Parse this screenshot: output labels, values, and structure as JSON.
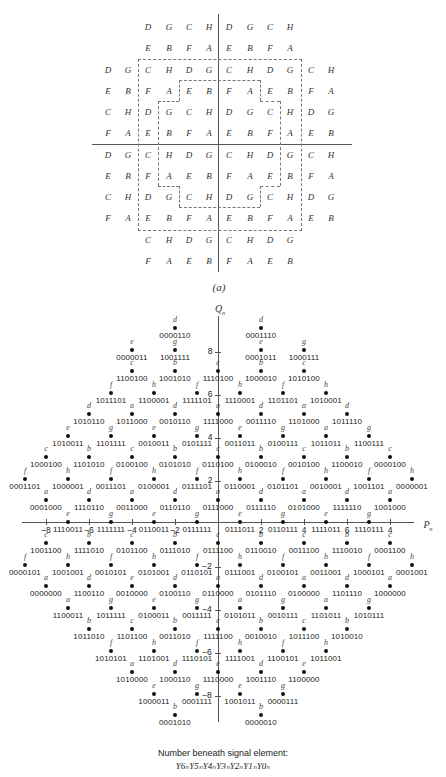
{
  "part_a": {
    "caption": "(a)",
    "rows": [
      {
        "y": 27,
        "cells": [
          "",
          "",
          "D",
          "G",
          "C",
          "H",
          "D",
          "G",
          "C",
          "H",
          "",
          ""
        ]
      },
      {
        "y": 48,
        "cells": [
          "",
          "",
          "E",
          "B",
          "F",
          "A",
          "E",
          "B",
          "F",
          "A",
          "",
          ""
        ]
      },
      {
        "y": 70,
        "cells": [
          "D",
          "G",
          "C",
          "H",
          "D",
          "G",
          "C",
          "H",
          "D",
          "G",
          "C",
          "H"
        ]
      },
      {
        "y": 91,
        "cells": [
          "E",
          "B",
          "F",
          "A",
          "E",
          "B",
          "F",
          "A",
          "E",
          "B",
          "F",
          "A"
        ]
      },
      {
        "y": 112,
        "cells": [
          "C",
          "H",
          "D",
          "G",
          "C",
          "H",
          "D",
          "G",
          "C",
          "H",
          "D",
          "G"
        ]
      },
      {
        "y": 133,
        "cells": [
          "F",
          "A",
          "E",
          "B",
          "F",
          "A",
          "E",
          "B",
          "F",
          "A",
          "E",
          "B"
        ]
      },
      {
        "y": 155,
        "cells": [
          "D",
          "G",
          "C",
          "H",
          "D",
          "G",
          "C",
          "H",
          "D",
          "G",
          "C",
          "H"
        ]
      },
      {
        "y": 176,
        "cells": [
          "E",
          "B",
          "F",
          "A",
          "E",
          "B",
          "F",
          "A",
          "E",
          "B",
          "F",
          "A"
        ]
      },
      {
        "y": 197,
        "cells": [
          "C",
          "H",
          "D",
          "G",
          "C",
          "H",
          "D",
          "G",
          "C",
          "H",
          "D",
          "G"
        ]
      },
      {
        "y": 218,
        "cells": [
          "F",
          "A",
          "E",
          "B",
          "F",
          "A",
          "E",
          "B",
          "F",
          "A",
          "E",
          "B"
        ]
      },
      {
        "y": 240,
        "cells": [
          "",
          "",
          "C",
          "H",
          "D",
          "G",
          "C",
          "H",
          "D",
          "G",
          "",
          ""
        ]
      },
      {
        "y": 261,
        "cells": [
          "",
          "",
          "F",
          "A",
          "E",
          "B",
          "F",
          "A",
          "E",
          "B",
          "",
          ""
        ]
      }
    ],
    "columns_x": [
      108,
      128,
      148,
      169,
      189,
      209,
      229,
      250,
      270,
      290,
      311,
      331
    ]
  },
  "part_b": {
    "y_axis_label": "Q",
    "y_axis_sub": "n",
    "x_axis_label": "P",
    "x_axis_sub": "n",
    "x_ticks": [
      {
        "x": 46,
        "label": "−8"
      },
      {
        "x": 89,
        "label": "−6"
      },
      {
        "x": 132,
        "label": "−4"
      },
      {
        "x": 175,
        "label": "−2"
      },
      {
        "x": 261,
        "label": "2"
      },
      {
        "x": 304,
        "label": "4"
      },
      {
        "x": 347,
        "label": "6"
      },
      {
        "x": 390,
        "label": "4"
      }
    ],
    "y_ticks": [
      {
        "y": 352,
        "label": "8"
      },
      {
        "y": 395,
        "label": "6"
      },
      {
        "y": 438,
        "label": "4"
      },
      {
        "y": 481,
        "label": "2"
      },
      {
        "y": 567,
        "label": "−2"
      },
      {
        "y": 610,
        "label": "−4"
      },
      {
        "y": 653,
        "label": "−6"
      },
      {
        "y": 696,
        "label": "−8"
      }
    ],
    "points": [
      {
        "x": 175,
        "y": 328,
        "l": "d",
        "c": "0000110"
      },
      {
        "x": 261,
        "y": 328,
        "l": "d",
        "c": "0001110"
      },
      {
        "x": 132,
        "y": 350,
        "l": "e",
        "c": "0000011"
      },
      {
        "x": 175,
        "y": 350,
        "l": "g",
        "c": "1001111"
      },
      {
        "x": 261,
        "y": 350,
        "l": "e",
        "c": "0001011"
      },
      {
        "x": 304,
        "y": 350,
        "l": "g",
        "c": "1000111"
      },
      {
        "x": 132,
        "y": 371,
        "l": "c",
        "c": "1100100"
      },
      {
        "x": 175,
        "y": 371,
        "l": "b",
        "c": "1001010"
      },
      {
        "x": 218,
        "y": 371,
        "l": "c",
        "c": "1110100"
      },
      {
        "x": 261,
        "y": 371,
        "l": "b",
        "c": "1000010"
      },
      {
        "x": 304,
        "y": 371,
        "l": "c",
        "c": "1010100"
      },
      {
        "x": 111,
        "y": 393,
        "l": "f",
        "c": "1011101"
      },
      {
        "x": 154,
        "y": 393,
        "l": "h",
        "c": "1100001"
      },
      {
        "x": 197,
        "y": 393,
        "l": "f",
        "c": "1111101"
      },
      {
        "x": 240,
        "y": 393,
        "l": "h",
        "c": "1110001"
      },
      {
        "x": 283,
        "y": 393,
        "l": "f",
        "c": "1101101"
      },
      {
        "x": 326,
        "y": 393,
        "l": "h",
        "c": "1010001"
      },
      {
        "x": 89,
        "y": 414,
        "l": "d",
        "c": "1010110"
      },
      {
        "x": 132,
        "y": 414,
        "l": "a",
        "c": "1011000"
      },
      {
        "x": 175,
        "y": 414,
        "l": "d",
        "c": "0010110"
      },
      {
        "x": 218,
        "y": 414,
        "l": "a",
        "c": "1111000"
      },
      {
        "x": 261,
        "y": 414,
        "l": "d",
        "c": "0011110"
      },
      {
        "x": 304,
        "y": 414,
        "l": "a",
        "c": "1101000"
      },
      {
        "x": 347,
        "y": 414,
        "l": "d",
        "c": "1011110"
      },
      {
        "x": 68,
        "y": 436,
        "l": "e",
        "c": "1010011"
      },
      {
        "x": 111,
        "y": 436,
        "l": "g",
        "c": "1101111"
      },
      {
        "x": 154,
        "y": 436,
        "l": "e",
        "c": "0010011"
      },
      {
        "x": 197,
        "y": 436,
        "l": "g",
        "c": "0101111"
      },
      {
        "x": 240,
        "y": 436,
        "l": "e",
        "c": "0011011"
      },
      {
        "x": 283,
        "y": 436,
        "l": "g",
        "c": "0100111"
      },
      {
        "x": 326,
        "y": 436,
        "l": "a",
        "c": "1011011"
      },
      {
        "x": 369,
        "y": 436,
        "l": "g",
        "c": "1100111"
      },
      {
        "x": 46,
        "y": 457,
        "l": "c",
        "c": "1000100"
      },
      {
        "x": 89,
        "y": 457,
        "l": "b",
        "c": "1101010"
      },
      {
        "x": 132,
        "y": 457,
        "l": "c",
        "c": "0100100"
      },
      {
        "x": 175,
        "y": 457,
        "l": "b",
        "c": "0101010"
      },
      {
        "x": 218,
        "y": 457,
        "l": "c",
        "c": "0110100"
      },
      {
        "x": 261,
        "y": 457,
        "l": "b",
        "c": "0100010"
      },
      {
        "x": 304,
        "y": 457,
        "l": "c",
        "c": "0010100"
      },
      {
        "x": 347,
        "y": 457,
        "l": "b",
        "c": "1100010"
      },
      {
        "x": 390,
        "y": 457,
        "l": "c",
        "c": "0000100"
      },
      {
        "x": 25,
        "y": 479,
        "l": "f",
        "c": "0001101"
      },
      {
        "x": 68,
        "y": 479,
        "l": "h",
        "c": "1000001"
      },
      {
        "x": 111,
        "y": 479,
        "l": "f",
        "c": "0011101"
      },
      {
        "x": 154,
        "y": 479,
        "l": "h",
        "c": "0100001"
      },
      {
        "x": 197,
        "y": 479,
        "l": "f",
        "c": "0111101"
      },
      {
        "x": 240,
        "y": 479,
        "l": "h",
        "c": "0110001"
      },
      {
        "x": 283,
        "y": 479,
        "l": "f",
        "c": "0101101"
      },
      {
        "x": 326,
        "y": 479,
        "l": "h",
        "c": "0010001"
      },
      {
        "x": 369,
        "y": 479,
        "l": "f",
        "c": "1001101"
      },
      {
        "x": 412,
        "y": 479,
        "l": "h",
        "c": "0000001"
      },
      {
        "x": 46,
        "y": 500,
        "l": "a",
        "c": "0001000"
      },
      {
        "x": 89,
        "y": 500,
        "l": "d",
        "c": "1110110"
      },
      {
        "x": 132,
        "y": 500,
        "l": "a",
        "c": "0011000"
      },
      {
        "x": 175,
        "y": 500,
        "l": "d",
        "c": "0110110"
      },
      {
        "x": 218,
        "y": 500,
        "l": "a",
        "c": "0111000"
      },
      {
        "x": 261,
        "y": 500,
        "l": "d",
        "c": "0111110"
      },
      {
        "x": 304,
        "y": 500,
        "l": "a",
        "c": "0101000"
      },
      {
        "x": 347,
        "y": 500,
        "l": "d",
        "c": "1111110"
      },
      {
        "x": 390,
        "y": 500,
        "l": "a",
        "c": "1001000"
      },
      {
        "x": 68,
        "y": 522,
        "l": "e",
        "c": "1110011"
      },
      {
        "x": 111,
        "y": 522,
        "l": "g",
        "c": "1111111"
      },
      {
        "x": 154,
        "y": 522,
        "l": "e",
        "c": "0110011"
      },
      {
        "x": 197,
        "y": 522,
        "l": "g",
        "c": "0111111"
      },
      {
        "x": 240,
        "y": 522,
        "l": "e",
        "c": "0111011"
      },
      {
        "x": 283,
        "y": 522,
        "l": "g",
        "c": "0110111"
      },
      {
        "x": 326,
        "y": 522,
        "l": "e",
        "c": "1111011"
      },
      {
        "x": 369,
        "y": 522,
        "l": "g",
        "c": "1110111"
      },
      {
        "x": 46,
        "y": 543,
        "l": "c",
        "c": "1001100"
      },
      {
        "x": 89,
        "y": 543,
        "l": "b",
        "c": "1111010"
      },
      {
        "x": 132,
        "y": 543,
        "l": "c",
        "c": "0101100"
      },
      {
        "x": 175,
        "y": 543,
        "l": "b",
        "c": "0111010"
      },
      {
        "x": 218,
        "y": 543,
        "l": "c",
        "c": "0111100"
      },
      {
        "x": 261,
        "y": 543,
        "l": "b",
        "c": "0110010"
      },
      {
        "x": 304,
        "y": 543,
        "l": "c",
        "c": "0011100"
      },
      {
        "x": 347,
        "y": 543,
        "l": "b",
        "c": "1110010"
      },
      {
        "x": 390,
        "y": 543,
        "l": "c",
        "c": "0001100"
      },
      {
        "x": 25,
        "y": 565,
        "l": "f",
        "c": "0000101"
      },
      {
        "x": 68,
        "y": 565,
        "l": "h",
        "c": "1001001"
      },
      {
        "x": 111,
        "y": 565,
        "l": "f",
        "c": "0010101"
      },
      {
        "x": 154,
        "y": 565,
        "l": "h",
        "c": "0101001"
      },
      {
        "x": 197,
        "y": 565,
        "l": "f",
        "c": "0110101"
      },
      {
        "x": 240,
        "y": 565,
        "l": "h",
        "c": "0111001"
      },
      {
        "x": 283,
        "y": 565,
        "l": "f",
        "c": "0100101"
      },
      {
        "x": 326,
        "y": 565,
        "l": "h",
        "c": "0011001"
      },
      {
        "x": 369,
        "y": 565,
        "l": "f",
        "c": "1000101"
      },
      {
        "x": 412,
        "y": 565,
        "l": "h",
        "c": "0001001"
      },
      {
        "x": 46,
        "y": 586,
        "l": "a",
        "c": "0000000"
      },
      {
        "x": 89,
        "y": 586,
        "l": "d",
        "c": "1100110"
      },
      {
        "x": 132,
        "y": 586,
        "l": "e",
        "c": "0010000"
      },
      {
        "x": 175,
        "y": 586,
        "l": "d",
        "c": "0100110"
      },
      {
        "x": 218,
        "y": 586,
        "l": "a",
        "c": "0110000"
      },
      {
        "x": 261,
        "y": 586,
        "l": "d",
        "c": "0101110"
      },
      {
        "x": 304,
        "y": 586,
        "l": "a",
        "c": "0100000"
      },
      {
        "x": 347,
        "y": 586,
        "l": "d",
        "c": "1101110"
      },
      {
        "x": 390,
        "y": 586,
        "l": "a",
        "c": "1000000"
      },
      {
        "x": 68,
        "y": 608,
        "l": "a",
        "c": "1100011"
      },
      {
        "x": 111,
        "y": 608,
        "l": "g",
        "c": "1011111"
      },
      {
        "x": 154,
        "y": 608,
        "l": "e",
        "c": "0100011"
      },
      {
        "x": 197,
        "y": 608,
        "l": "g",
        "c": "0011111"
      },
      {
        "x": 240,
        "y": 608,
        "l": "a",
        "c": "0101011"
      },
      {
        "x": 283,
        "y": 608,
        "l": "g",
        "c": "0010111"
      },
      {
        "x": 326,
        "y": 608,
        "l": "a",
        "c": "1101011"
      },
      {
        "x": 369,
        "y": 608,
        "l": "g",
        "c": "1010111"
      },
      {
        "x": 89,
        "y": 629,
        "l": "b",
        "c": "1011010"
      },
      {
        "x": 132,
        "y": 629,
        "l": "c",
        "c": "1101100"
      },
      {
        "x": 175,
        "y": 629,
        "l": "b",
        "c": "0011010"
      },
      {
        "x": 218,
        "y": 629,
        "l": "c",
        "c": "1111100"
      },
      {
        "x": 261,
        "y": 629,
        "l": "b",
        "c": "0010010"
      },
      {
        "x": 304,
        "y": 629,
        "l": "c",
        "c": "1011100"
      },
      {
        "x": 347,
        "y": 629,
        "l": "b",
        "c": "1010010"
      },
      {
        "x": 111,
        "y": 651,
        "l": "f",
        "c": "1010101"
      },
      {
        "x": 154,
        "y": 651,
        "l": "h",
        "c": "1101001"
      },
      {
        "x": 197,
        "y": 651,
        "l": "f",
        "c": "1110101"
      },
      {
        "x": 240,
        "y": 651,
        "l": "h",
        "c": "1111001"
      },
      {
        "x": 283,
        "y": 651,
        "l": "f",
        "c": "1100101"
      },
      {
        "x": 326,
        "y": 651,
        "l": "h",
        "c": "1011001"
      },
      {
        "x": 132,
        "y": 672,
        "l": "a",
        "c": "1010000"
      },
      {
        "x": 175,
        "y": 672,
        "l": "d",
        "c": "1000110"
      },
      {
        "x": 218,
        "y": 672,
        "l": "e",
        "c": "1110000"
      },
      {
        "x": 261,
        "y": 672,
        "l": "d",
        "c": "1001110"
      },
      {
        "x": 304,
        "y": 672,
        "l": "e",
        "c": "1100000"
      },
      {
        "x": 154,
        "y": 694,
        "l": "e",
        "c": "1000011"
      },
      {
        "x": 197,
        "y": 694,
        "l": "g",
        "c": "0001111"
      },
      {
        "x": 240,
        "y": 694,
        "l": "e",
        "c": "1001011"
      },
      {
        "x": 283,
        "y": 694,
        "l": "g",
        "c": "0000111"
      },
      {
        "x": 175,
        "y": 715,
        "l": "b",
        "c": "0001010"
      },
      {
        "x": 261,
        "y": 715,
        "l": "b",
        "c": "0000010"
      }
    ],
    "note_line1": "Number beneath signal element:",
    "note_line2": "Y6ₙY5ₙY4ₙY3ₙY2ₙY1ₙY0ₙ"
  }
}
